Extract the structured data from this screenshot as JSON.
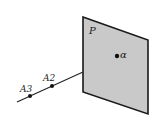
{
  "diagram": {
    "plane": {
      "label": "P",
      "fill": "#c9c9c9",
      "stroke": "#1a1a1a",
      "corners": [
        [
          83,
          17
        ],
        [
          148,
          40
        ],
        [
          148,
          114
        ],
        [
          83,
          92
        ]
      ],
      "label_pos": [
        89,
        34
      ]
    },
    "point_alpha": {
      "label": "α",
      "pos": [
        117,
        56
      ],
      "label_pos": [
        120,
        58
      ]
    },
    "line": {
      "start": [
        17,
        102
      ],
      "end": [
        83,
        72
      ],
      "stroke": "#222222"
    },
    "points_on_line": [
      {
        "label": "A3",
        "pos": [
          30,
          96
        ],
        "label_pos": [
          20,
          92
        ]
      },
      {
        "label": "A2",
        "pos": [
          52,
          86
        ],
        "label_pos": [
          43,
          81
        ]
      }
    ]
  }
}
